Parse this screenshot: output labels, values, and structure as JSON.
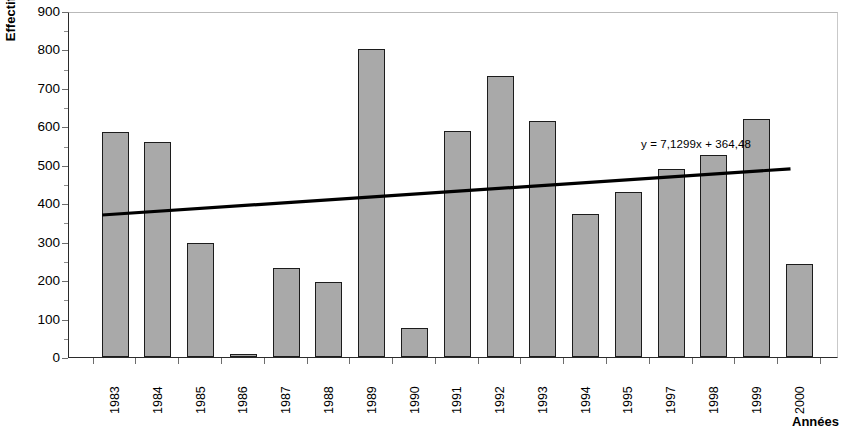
{
  "chart_data": {
    "type": "bar",
    "title": "",
    "subtitle": "",
    "xlabel": "Années",
    "ylabel": "Effectifs",
    "categories": [
      "1983",
      "1984",
      "1985",
      "1986",
      "1987",
      "1988",
      "1989",
      "1990",
      "1991",
      "1992",
      "1993",
      "1994",
      "1995",
      "1997",
      "1998",
      "1999",
      "2000"
    ],
    "values": [
      585,
      560,
      297,
      5,
      232,
      195,
      800,
      75,
      588,
      732,
      613,
      372,
      430,
      490,
      525,
      620,
      242
    ],
    "series": [
      {
        "name": "Effectifs",
        "values": [
          585,
          560,
          297,
          5,
          232,
          195,
          800,
          75,
          588,
          732,
          613,
          372,
          430,
          490,
          525,
          620,
          242
        ]
      }
    ],
    "ylim": [
      0,
      900
    ],
    "y_ticks": [
      0,
      100,
      200,
      300,
      400,
      500,
      600,
      700,
      800,
      900
    ],
    "y_tick_labels": [
      "0",
      "100",
      "200",
      "300",
      "400",
      "500",
      "600",
      "700",
      "800",
      "900"
    ],
    "grid": false,
    "legend": "none",
    "bar_color": "#a9a9a9",
    "bar_border_color": "#1c1c1c",
    "trendline": {
      "equation": "y = 7,1299x + 364,48",
      "slope": 7.1299,
      "intercept": 364.48,
      "start_value": 372,
      "end_value": 492,
      "color": "#000000"
    }
  },
  "axes": {
    "y_title": "Effectifs",
    "x_title": "Années",
    "y_ticks": [
      "900",
      "800",
      "700",
      "600",
      "500",
      "400",
      "300",
      "200",
      "100",
      "0"
    ],
    "x_labels": [
      "1983",
      "1984",
      "1985",
      "1986",
      "1987",
      "1988",
      "1989",
      "1990",
      "1991",
      "1992",
      "1993",
      "1994",
      "1995",
      "1997",
      "1998",
      "1999",
      "2000"
    ]
  },
  "annotations": {
    "trend_equation": "y = 7,1299x + 364,48"
  }
}
